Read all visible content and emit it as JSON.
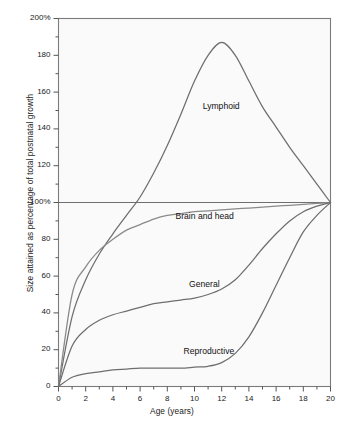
{
  "chart_data": {
    "type": "line",
    "title": "",
    "xlabel": "Age (years)",
    "ylabel": "Size attained as percentage of total postnatal growth",
    "xlim": [
      0,
      20
    ],
    "ylim": [
      0,
      200
    ],
    "xticks": [
      "0",
      "2",
      "4",
      "6",
      "8",
      "10",
      "12",
      "14",
      "16",
      "18",
      "20"
    ],
    "xtick_values": [
      0,
      2,
      4,
      6,
      8,
      10,
      12,
      14,
      16,
      18,
      20
    ],
    "xtick_minor_step": 1,
    "yticks": [
      "0",
      "20",
      "40",
      "60",
      "80",
      "100%",
      "120",
      "140",
      "160",
      "180",
      "200%"
    ],
    "ytick_values": [
      0,
      20,
      40,
      60,
      80,
      100,
      120,
      140,
      160,
      180,
      200
    ],
    "ytick_minor_step": 10,
    "grid": false,
    "reference_line": {
      "y": 100,
      "label": "100%"
    },
    "legend_position": "inline-annotations",
    "x": [
      0,
      1,
      2,
      3,
      4,
      5,
      6,
      7,
      8,
      9,
      10,
      11,
      12,
      13,
      14,
      15,
      16,
      17,
      18,
      19,
      20
    ],
    "series": [
      {
        "name": "Lymphoid",
        "color": "#6e6e6e",
        "values": [
          0,
          38,
          58,
          72,
          83,
          93,
          103,
          116,
          131,
          148,
          166,
          180,
          187,
          180,
          166,
          152,
          141,
          130,
          120,
          110,
          100
        ]
      },
      {
        "name": "Brain and head",
        "color": "#8a8a8a",
        "values": [
          0,
          50,
          65,
          74,
          80,
          85,
          88,
          91,
          93,
          94,
          95,
          95.5,
          96,
          96.5,
          97,
          97.5,
          98,
          98.5,
          99,
          99.5,
          100
        ]
      },
      {
        "name": "General",
        "color": "#6e6e6e",
        "values": [
          0,
          22,
          31,
          36,
          39,
          41,
          43,
          45,
          46,
          47,
          48,
          50,
          53,
          58,
          66,
          75,
          83,
          90,
          95,
          98,
          100
        ]
      },
      {
        "name": "Reproductive",
        "color": "#6e6e6e",
        "values": [
          0,
          5,
          7,
          8,
          9,
          9.5,
          10,
          10,
          10,
          10,
          10.5,
          11,
          13,
          18,
          27,
          40,
          55,
          70,
          84,
          93,
          100
        ]
      }
    ],
    "annotations": [
      {
        "text": "Lymphoid",
        "x": 10.6,
        "y": 152
      },
      {
        "text": "Brain and head",
        "x": 8.6,
        "y": 92
      },
      {
        "text": "General",
        "x": 9.6,
        "y": 55
      },
      {
        "text": "Reproductive",
        "x": 9.2,
        "y": 19
      }
    ]
  },
  "style": {
    "plot_bg": "#fafafa",
    "frame_color": "#7b7b7b",
    "axis_color": "#555555",
    "text_color": "#1a1a1a"
  }
}
